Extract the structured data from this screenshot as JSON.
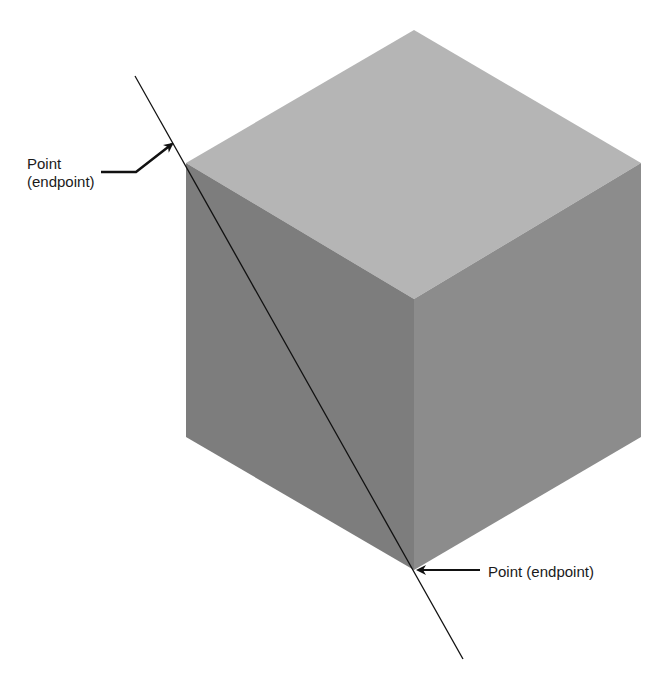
{
  "figure": {
    "colors": {
      "background": "#ffffff",
      "top_face": "#b5b5b5",
      "left_face": "#7d7d7d",
      "right_face": "#8c8c8c",
      "line": "#111111",
      "arrow": "#111111",
      "text": "#1a1a1a"
    },
    "cube": {
      "top_vertex": [
        414,
        30
      ],
      "upper_left": [
        186,
        163
      ],
      "upper_right": [
        641,
        163
      ],
      "front_top": [
        414,
        299
      ],
      "lower_left": [
        186,
        437
      ],
      "lower_right": [
        641,
        437
      ],
      "front_bottom": [
        414,
        570
      ]
    },
    "line": {
      "start": [
        135,
        76
      ],
      "end": [
        463,
        659
      ]
    }
  },
  "annotations": {
    "top": {
      "line1": "Point",
      "line2": "(endpoint)"
    },
    "bottom": {
      "text": "Point (endpoint)"
    }
  }
}
